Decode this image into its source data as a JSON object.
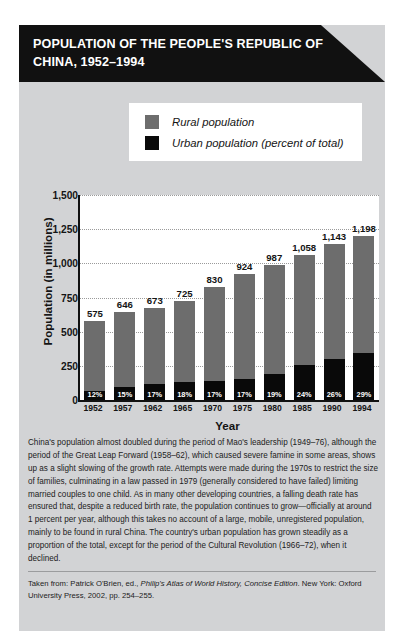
{
  "header": {
    "title": "POPULATION OF THE PEOPLE'S REPUBLIC OF CHINA, 1952–1994"
  },
  "legend": {
    "items": [
      {
        "label": "Rural population",
        "color": "#6d6d6d",
        "swatch_name": "rural-swatch"
      },
      {
        "label": "Urban population (percent of total)",
        "color": "#090909",
        "swatch_name": "urban-swatch"
      }
    ]
  },
  "chart_data": {
    "type": "bar",
    "title": "POPULATION OF THE PEOPLE'S REPUBLIC OF CHINA, 1952–1994",
    "xlabel": "Year",
    "ylabel": "Population (in millions)",
    "categories": [
      "1952",
      "1957",
      "1962",
      "1965",
      "1970",
      "1975",
      "1980",
      "1985",
      "1990",
      "1994"
    ],
    "ylim": [
      0,
      1500
    ],
    "yticks": [
      1500,
      1250,
      1000,
      750,
      500,
      250,
      0
    ],
    "ytick_labels": [
      "1,500",
      "1,250",
      "1,000",
      "750",
      "500",
      "250",
      "0"
    ],
    "grid": true,
    "legend_position": "above-plot",
    "stacked": true,
    "series": [
      {
        "name": "Rural population",
        "color": "#6d6d6d",
        "values": [
          575,
          646,
          673,
          725,
          830,
          924,
          987,
          1058,
          1143,
          1198
        ]
      },
      {
        "name": "Urban population (percent of total)",
        "color": "#090909",
        "percent_values": [
          12,
          15,
          17,
          18,
          17,
          17,
          19,
          24,
          26,
          29
        ],
        "percent_labels": [
          "12%",
          "15%",
          "17%",
          "18%",
          "17%",
          "17%",
          "19%",
          "24%",
          "26%",
          "29%"
        ]
      }
    ],
    "total_labels": [
      "575",
      "646",
      "673",
      "725",
      "830",
      "924",
      "987",
      "1,058",
      "1,143",
      "1,198"
    ]
  },
  "body": {
    "paragraph": "China's population almost doubled during the period of Mao's leadership (1949–76), although the period of the Great Leap Forward (1958–62), which caused severe famine in some areas, shows up as a slight slowing of the growth rate. Attempts were made during the 1970s to restrict the size of families, culminating in a law passed in 1979 (generally considered to have failed) limiting married couples to one child. As in many other developing countries, a falling death rate has ensured that, despite a reduced birth rate, the population continues to grow—officially at around 1 percent per year, although this takes no account of a large, mobile, unregistered population, mainly to be found in rural China. The country's urban population has grown steadily as a proportion of the total, except for the period of the Cultural Revolution (1966–72), when it declined."
  },
  "source": {
    "prefix": "Taken from: Patrick O'Brien, ed., ",
    "work_italic": "Philip's Atlas of World History, Concise Edition",
    "suffix": ". New York: Oxford University Press, 2002, pp. 254–255."
  }
}
